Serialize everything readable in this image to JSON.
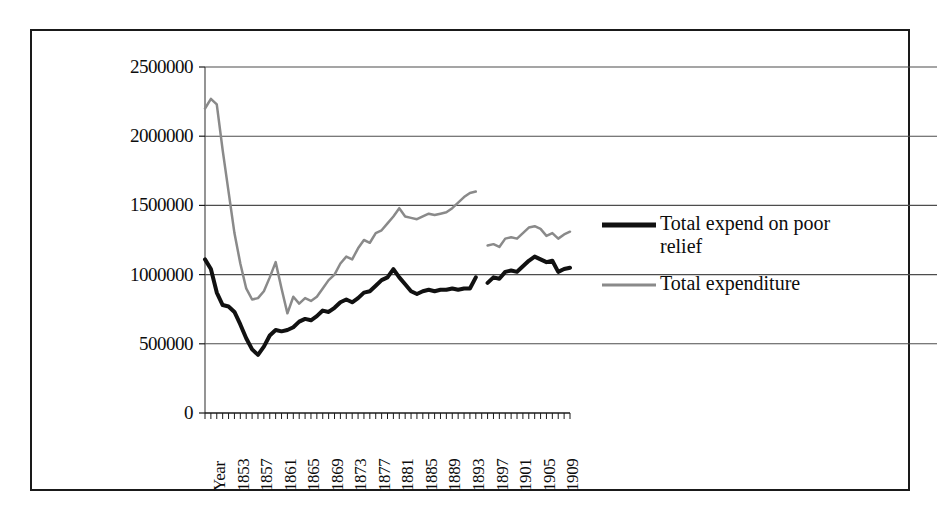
{
  "figure": {
    "border_color": "#1a1a1a",
    "background": "#ffffff"
  },
  "legend": {
    "position": "right",
    "entries": [
      {
        "label": "Total expend on poor\nrelief",
        "color": "#111111",
        "style": "thick-solid",
        "name": "series-poor-relief"
      },
      {
        "label": "Total expenditure",
        "color": "#8a8a8a",
        "style": "thin-solid",
        "name": "series-total-expenditure"
      }
    ]
  },
  "axes": {
    "y_ticks": [
      "0",
      "500000",
      "1000000",
      "1500000",
      "2000000",
      "2500000"
    ],
    "x_ticks": [
      "Year",
      "1853",
      "1857",
      "1861",
      "1865",
      "1869",
      "1873",
      "1877",
      "1881",
      "1885",
      "1889",
      "1893",
      "1897",
      "1901",
      "1905",
      "1909"
    ]
  },
  "chart_data": {
    "type": "line",
    "title": "",
    "xlabel": "Year",
    "ylabel": "",
    "ylim": [
      0,
      2500000
    ],
    "xlim": [
      1849,
      1911
    ],
    "grid": true,
    "legend_position": "right",
    "ytick_values": [
      0,
      500000,
      1000000,
      1500000,
      2000000,
      2500000
    ],
    "xtick_labels": [
      "Year",
      "1853",
      "1857",
      "1861",
      "1865",
      "1869",
      "1873",
      "1877",
      "1881",
      "1885",
      "1889",
      "1893",
      "1897",
      "1901",
      "1905",
      "1909"
    ],
    "xtick_years": [
      1849,
      1853,
      1857,
      1861,
      1865,
      1869,
      1873,
      1877,
      1881,
      1885,
      1889,
      1893,
      1897,
      1901,
      1905,
      1909
    ],
    "note": "Both series have a data break between 1895 and 1897.",
    "series": [
      {
        "name": "Total expend on poor relief",
        "color": "#111111",
        "linewidth": 4,
        "segments": [
          {
            "x": [
              1849,
              1850,
              1851,
              1852,
              1853,
              1854,
              1855,
              1856,
              1857,
              1858,
              1859,
              1860,
              1861,
              1862,
              1863,
              1864,
              1865,
              1866,
              1867,
              1868,
              1869,
              1870,
              1871,
              1872,
              1873,
              1874,
              1875,
              1876,
              1877,
              1878,
              1879,
              1880,
              1881,
              1882,
              1883,
              1884,
              1885,
              1886,
              1887,
              1888,
              1889,
              1890,
              1891,
              1892,
              1893,
              1894,
              1895
            ],
            "y": [
              1110000,
              1040000,
              870000,
              780000,
              770000,
              730000,
              640000,
              540000,
              460000,
              420000,
              480000,
              560000,
              600000,
              590000,
              600000,
              620000,
              660000,
              680000,
              670000,
              700000,
              740000,
              730000,
              760000,
              800000,
              820000,
              800000,
              830000,
              870000,
              880000,
              920000,
              960000,
              980000,
              1040000,
              980000,
              930000,
              880000,
              860000,
              880000,
              890000,
              880000,
              890000,
              890000,
              900000,
              890000,
              900000,
              900000,
              980000
            ]
          },
          {
            "x": [
              1897,
              1898,
              1899,
              1900,
              1901,
              1902,
              1903,
              1904,
              1905,
              1906,
              1907,
              1908,
              1909,
              1910,
              1911
            ],
            "y": [
              940000,
              980000,
              970000,
              1020000,
              1030000,
              1020000,
              1060000,
              1100000,
              1130000,
              1110000,
              1090000,
              1100000,
              1020000,
              1040000,
              1050000
            ]
          }
        ]
      },
      {
        "name": "Total expenditure",
        "color": "#8a8a8a",
        "linewidth": 2.5,
        "segments": [
          {
            "x": [
              1849,
              1850,
              1851,
              1852,
              1853,
              1854,
              1855,
              1856,
              1857,
              1858,
              1859,
              1860,
              1861,
              1862,
              1863,
              1864,
              1865,
              1866,
              1867,
              1868,
              1869,
              1870,
              1871,
              1872,
              1873,
              1874,
              1875,
              1876,
              1877,
              1878,
              1879,
              1880,
              1881,
              1882,
              1883,
              1884,
              1885,
              1886,
              1887,
              1888,
              1889,
              1890,
              1891,
              1892,
              1893,
              1894,
              1895
            ],
            "y": [
              2200000,
              2270000,
              2230000,
              1900000,
              1600000,
              1300000,
              1080000,
              900000,
              820000,
              830000,
              880000,
              980000,
              1090000,
              900000,
              720000,
              840000,
              790000,
              830000,
              810000,
              840000,
              900000,
              960000,
              1000000,
              1080000,
              1130000,
              1110000,
              1190000,
              1250000,
              1230000,
              1300000,
              1320000,
              1370000,
              1420000,
              1480000,
              1420000,
              1410000,
              1400000,
              1420000,
              1440000,
              1430000,
              1440000,
              1450000,
              1480000,
              1520000,
              1560000,
              1590000,
              1600000
            ]
          },
          {
            "x": [
              1897,
              1898,
              1899,
              1900,
              1901,
              1902,
              1903,
              1904,
              1905,
              1906,
              1907,
              1908,
              1909,
              1910,
              1911
            ],
            "y": [
              1210000,
              1220000,
              1200000,
              1260000,
              1270000,
              1260000,
              1300000,
              1340000,
              1350000,
              1330000,
              1280000,
              1300000,
              1260000,
              1290000,
              1310000
            ]
          }
        ]
      }
    ]
  }
}
